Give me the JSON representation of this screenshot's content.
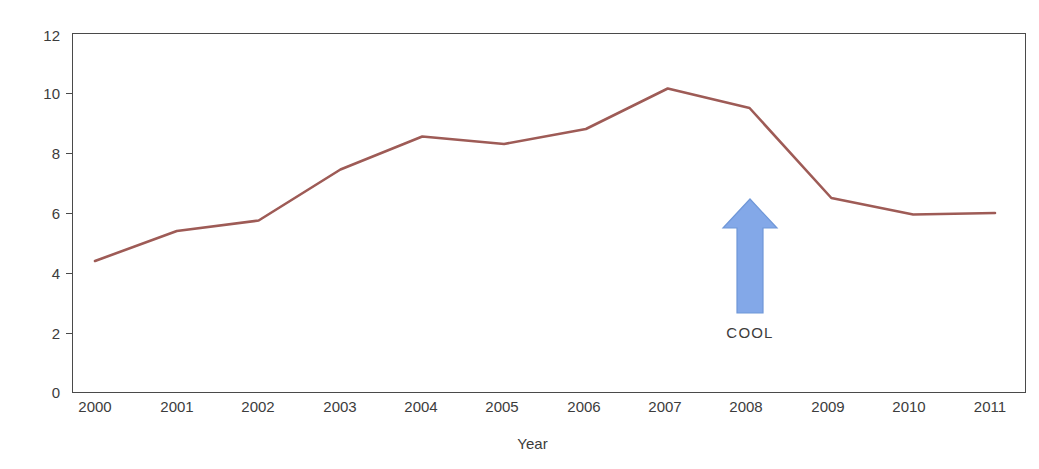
{
  "chart_data": {
    "type": "line",
    "title": "",
    "xlabel": "Year",
    "ylabel": "",
    "categories": [
      "2000",
      "2001",
      "2002",
      "2003",
      "2004",
      "2005",
      "2006",
      "2007",
      "2008",
      "2009",
      "2010",
      "2011"
    ],
    "values": [
      4.4,
      5.4,
      5.75,
      7.45,
      8.55,
      8.3,
      8.8,
      10.15,
      9.5,
      6.5,
      5.95,
      6.0
    ],
    "series": [
      {
        "name": "",
        "color": "#9e5b56",
        "values": [
          4.4,
          5.4,
          5.75,
          7.45,
          8.55,
          8.3,
          8.8,
          10.15,
          9.5,
          6.5,
          5.95,
          6.0
        ]
      }
    ],
    "ylim": [
      0,
      12
    ],
    "ytick_labels": [
      "0",
      "2",
      "4",
      "6",
      "8",
      "10",
      "12"
    ],
    "ytick_values": [
      0,
      2,
      4,
      6,
      8,
      10,
      12
    ],
    "xtick_labels": [
      "2000",
      "2001",
      "2002",
      "2003",
      "2004",
      "2005",
      "2006",
      "2007",
      "2008",
      "2009",
      "2010",
      "2011"
    ],
    "grid": false,
    "legend": "none",
    "annotations": [
      {
        "type": "arrow-up",
        "label": "COOL",
        "at_category": "2008",
        "color": "#83a8e8",
        "outline_color": "#6f97d8"
      }
    ]
  },
  "axes": {
    "y_labels": [
      "12",
      "10",
      "8",
      "6",
      "4",
      "2",
      "0"
    ],
    "x_labels": [
      "2000",
      "2001",
      "2002",
      "2003",
      "2004",
      "2005",
      "2006",
      "2007",
      "2008",
      "2009",
      "2010",
      "2011"
    ],
    "x_title": "Year"
  },
  "annotation": {
    "label": "COOL",
    "icon": "arrow-up-icon",
    "color": "#83a8e8"
  },
  "title": {
    "text": ""
  }
}
